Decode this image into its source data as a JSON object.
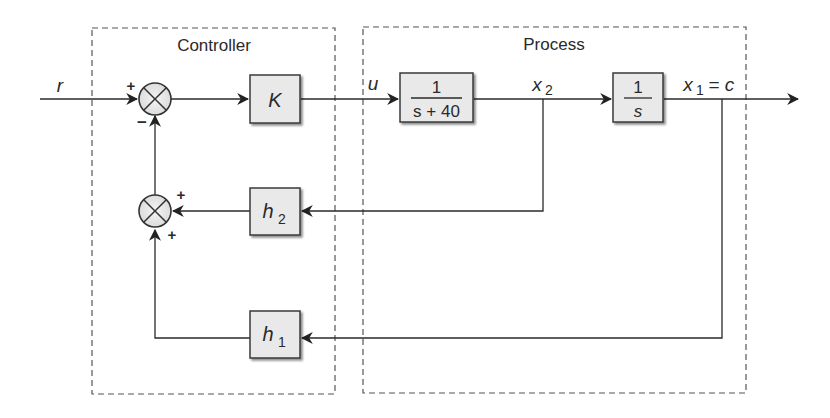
{
  "diagram": {
    "type": "block-diagram",
    "groups": {
      "controller": {
        "label": "Controller"
      },
      "process": {
        "label": "Process"
      }
    },
    "signals": {
      "reference": "r",
      "control": "u",
      "state2": "x",
      "state2_sub": "2",
      "state1": "x",
      "state1_sub": "1",
      "output_eq": " = c"
    },
    "blocks": {
      "gain": {
        "label": "K"
      },
      "plant1": {
        "numerator": "1",
        "denominator": "s + 40"
      },
      "plant2": {
        "numerator": "1",
        "denominator": "s"
      },
      "feedback2": {
        "label": "h",
        "sub": "2"
      },
      "feedback1": {
        "label": "h",
        "sub": "1"
      }
    },
    "summing_junctions": {
      "sum1": {
        "plus": "+",
        "minus": "−"
      },
      "sum2": {
        "plus_right": "+",
        "plus_bottom": "+"
      }
    },
    "colors": {
      "line": "#2a2a2a",
      "block_fill": "#e9e9e9",
      "block_border": "#3a3a3a",
      "dash": "#555555"
    }
  }
}
